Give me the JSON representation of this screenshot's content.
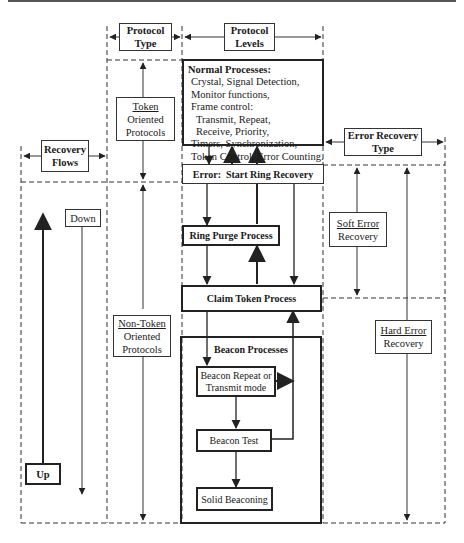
{
  "headers": {
    "protocol_type": [
      "Protocol",
      "Type"
    ],
    "protocol_levels": [
      "Protocol",
      "Levels"
    ],
    "recovery_flows": [
      "Recovery",
      "Flows"
    ],
    "error_recovery_type": [
      "Error Recovery",
      "Type"
    ]
  },
  "protocol_column": {
    "token": {
      "underlined": "Token",
      "rest": [
        "Oriented",
        "Protocols"
      ]
    },
    "non_token": {
      "underlined": "Non-Token",
      "rest": [
        "Oriented",
        "Protocols"
      ]
    }
  },
  "recovery_flows": {
    "down": "Down",
    "up": "Up"
  },
  "error_recovery": {
    "soft": {
      "underlined": "Soft Error",
      "rest": "Recovery"
    },
    "hard": {
      "underlined": "Hard Error",
      "rest": "Recovery"
    }
  },
  "normal_processes": {
    "title": "Normal Processes:",
    "lines": [
      "Crystal, Signal Detection,",
      "Monitor functions,",
      "Frame control:",
      "Transmit, Repeat,",
      "Receive, Priority,",
      "Timers, Synchronization,",
      "Token Control, Error Counting."
    ]
  },
  "processes": {
    "error_start": "Error:  Start Ring Recovery",
    "ring_purge": "Ring Purge Process",
    "claim_token": "Claim Token Process",
    "beacon_group": "Beacon Processes",
    "beacon_repeat": [
      "Beacon Repeat or",
      "Transmit mode"
    ],
    "beacon_test": "Beacon Test",
    "solid_beaconing": "Solid Beaconing"
  },
  "colors": {
    "line": "#333333",
    "background": "#ffffff"
  }
}
